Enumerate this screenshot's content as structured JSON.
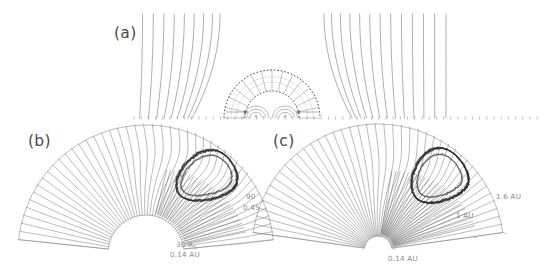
{
  "figure": {
    "kind": "scientific-figure",
    "background_color": "#ffffff",
    "line_color": "#6e6e6e",
    "flux_rope_color": "#2b2b2b",
    "label_color": "#4a4a4a",
    "annotation_color": "#8d8d8d"
  },
  "panels": [
    {
      "id": "a",
      "label": "(a)",
      "label_x": 114,
      "label_y": 38,
      "type": "near-sun-field-lines-with-dome",
      "annotations": []
    },
    {
      "id": "b",
      "label": "(b)",
      "label_x": 28,
      "label_y": 146,
      "type": "annular-sector-flux-rope",
      "annotations": []
    },
    {
      "id": "c",
      "label": "(c)",
      "label_x": 273,
      "label_y": 146,
      "type": "annular-sector-flux-rope",
      "annotations": []
    }
  ],
  "annotations": {
    "angle_label": {
      "text": "90",
      "x": 246,
      "y": 199
    },
    "angle_value": {
      "text": "0.45",
      "x": 243,
      "y": 210
    },
    "panel_b_radius_value": {
      "text": "30 R",
      "subscript": "S",
      "x": 176,
      "y": 247
    },
    "panel_b_radius_au": {
      "text": "0.14 AU",
      "x": 170,
      "y": 257
    },
    "panel_c_inner_au": {
      "text": "0.14 AU",
      "x": 388,
      "y": 261
    },
    "panel_c_mid_au": {
      "text": "1 AU",
      "x": 456,
      "y": 218
    },
    "panel_c_outer_au": {
      "text": "1.6 AU",
      "x": 496,
      "y": 199
    }
  },
  "chart_data": {
    "type": "line",
    "title": "",
    "xlabel": "",
    "ylabel": "",
    "panel_a": {
      "description": "Open solar magnetic field lines deflecting around a hemispherical CME dome; two concentric dashed arcs with radial spokes; small closed arcade loops at the base",
      "dome_center_x": 272,
      "dome_center_y": 118,
      "dome_outer_radius": 48,
      "dome_inner_radius": 27,
      "dashed_arcs": 2,
      "radial_spokes": 14,
      "field_line_count": 26,
      "base_loops": 2
    },
    "panel_b": {
      "description": "Annular sector (fan) spanning a wide angle, filled with draped magnetic field lines and an embedded dark tangled flux rope",
      "apex_x": 146,
      "apex_y": 253,
      "inner_radius": 38,
      "outer_radius": 128,
      "start_angle_deg": 186,
      "end_angle_deg": 354,
      "field_line_count": 46,
      "flux_rope_present": true,
      "inner_boundary_label": "0.14 AU",
      "inner_boundary_label_rs": "30 RS"
    },
    "panel_c": {
      "description": "Annular sector (fan) with draped field lines and a dark flux rope, spanning 0.14 AU to 1.6 AU",
      "apex_x": 378,
      "apex_y": 250,
      "inner_radius": 14,
      "outer_radius": 126,
      "start_angle_deg": 188,
      "end_angle_deg": 352,
      "field_line_count": 44,
      "flux_rope_present": true,
      "radial_ticks": [
        "0.14 AU",
        "1 AU",
        "1.6 AU"
      ]
    }
  }
}
